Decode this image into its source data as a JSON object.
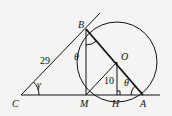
{
  "diagram": {
    "type": "geometry",
    "points": {
      "C": {
        "label": "C",
        "x": 21,
        "y": 95
      },
      "M": {
        "label": "M",
        "x": 86,
        "y": 95
      },
      "H": {
        "label": "H",
        "x": 117,
        "y": 95
      },
      "A": {
        "label": "A",
        "x": 143,
        "y": 95
      },
      "B": {
        "label": "B",
        "x": 86,
        "y": 29
      },
      "O": {
        "label": "O",
        "x": 117,
        "y": 62
      }
    },
    "circle": {
      "center": "O",
      "radius": 40
    },
    "labels": {
      "side_CB": "29",
      "segment_OH": "10",
      "angle_C": "γ",
      "angle_B": "θ",
      "angle_A": "θ"
    },
    "segments": [
      "C-B (extended tangent)",
      "C-A (extended baseline)",
      "B-M",
      "B-A",
      "M-O",
      "O-H"
    ],
    "right_angle_at": "H"
  }
}
